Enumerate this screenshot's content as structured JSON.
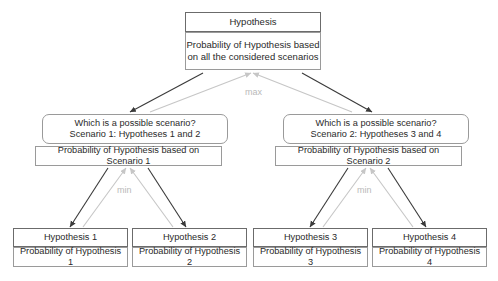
{
  "diagram": {
    "colors": {
      "arrow_down": "#3a3a3a",
      "arrow_up": "#c6c6c6",
      "border_strong": "#6b6b6b",
      "border_light": "#9a9a9a",
      "text": "#2a2a2a",
      "op_label": "#b9b9b9",
      "background": "#ffffff"
    },
    "operators": {
      "max": "max",
      "min_left": "min",
      "min_right": "min"
    },
    "root": {
      "head": "Hypothesis",
      "body_line1": "Probability of Hypothesis based",
      "body_line2": "on all the considered scenarios"
    },
    "scenarios": [
      {
        "head_line1": "Which is a possible scenario?",
        "head_line2": "Scenario 1: Hypotheses 1 and 2",
        "body": "Probability of Hypothesis based on Scenario 1"
      },
      {
        "head_line1": "Which is a possible scenario?",
        "head_line2": "Scenario 2: Hypotheses 3 and 4",
        "body": "Probability of Hypothesis based on Scenario 2"
      }
    ],
    "leaves": [
      {
        "head": "Hypothesis 1",
        "body": "Probability of Hypothesis 1"
      },
      {
        "head": "Hypothesis 2",
        "body": "Probability of Hypothesis 2"
      },
      {
        "head": "Hypothesis 3",
        "body": "Probability of Hypothesis 3"
      },
      {
        "head": "Hypothesis 4",
        "body": "Probability of Hypothesis 4"
      }
    ]
  }
}
